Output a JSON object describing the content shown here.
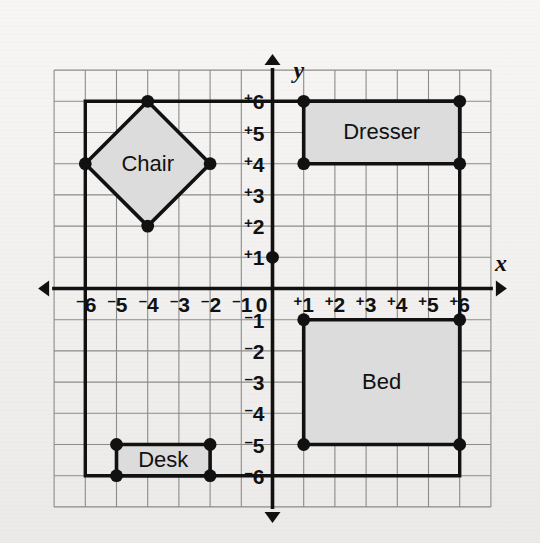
{
  "figure": {
    "background_color": "#f2f1ef",
    "ink_color": "#111111",
    "grid_color": "#8b8b8b",
    "shape_fill_color": "#dcdcdc"
  },
  "axes": {
    "x_label": "x",
    "y_label": "y",
    "origin_label": "0",
    "x_ticks": [
      "-6",
      "-5",
      "-4",
      "-3",
      "-2",
      "-1",
      "+1",
      "+2",
      "+3",
      "+4",
      "+5",
      "+6"
    ],
    "y_ticks": [
      "+6",
      "+5",
      "+4",
      "+3",
      "+2",
      "+1",
      "-1",
      "-2",
      "-3",
      "-4",
      "-5",
      "-6"
    ],
    "x_range": [
      -7,
      7
    ],
    "y_range": [
      -7,
      7
    ],
    "grid": true
  },
  "chart_data": {
    "type": "scatter",
    "xlabel": "x",
    "ylabel": "y",
    "xlim": [
      -7,
      7
    ],
    "ylim": [
      -7,
      7
    ],
    "grid": true,
    "x_tick_labels": [
      "-6",
      "-5",
      "-4",
      "-3",
      "-2",
      "-1",
      "0",
      "+1",
      "+2",
      "+3",
      "+4",
      "+5",
      "+6"
    ],
    "y_tick_labels": [
      "+6",
      "+5",
      "+4",
      "+3",
      "+2",
      "+1",
      "0",
      "-1",
      "-2",
      "-3",
      "-4",
      "-5",
      "-6"
    ],
    "x_tick_values": [
      -6,
      -5,
      -4,
      -3,
      -2,
      -1,
      0,
      1,
      2,
      3,
      4,
      5,
      6
    ],
    "y_tick_values": [
      6,
      5,
      4,
      3,
      2,
      1,
      0,
      -1,
      -2,
      -3,
      -4,
      -5,
      -6
    ],
    "room_outline": {
      "name": "room",
      "vertices": [
        [
          -6,
          6
        ],
        [
          6,
          6
        ],
        [
          6,
          -6
        ],
        [
          -6,
          -6
        ]
      ],
      "closed": true,
      "filled": false
    },
    "marked_points": [
      [
        0,
        1
      ]
    ],
    "shapes": [
      {
        "name": "Chair",
        "label": "Chair",
        "kind": "polygon",
        "vertices": [
          [
            -4,
            6
          ],
          [
            -2,
            4
          ],
          [
            -4,
            2
          ],
          [
            -6,
            4
          ]
        ],
        "label_position": [
          -4,
          4
        ],
        "fill": "#dcdcdc"
      },
      {
        "name": "Dresser",
        "label": "Dresser",
        "kind": "rectangle",
        "vertices": [
          [
            1,
            6
          ],
          [
            6,
            6
          ],
          [
            6,
            4
          ],
          [
            1,
            4
          ]
        ],
        "label_position": [
          3.5,
          5
        ],
        "fill": "#dcdcdc"
      },
      {
        "name": "Bed",
        "label": "Bed",
        "kind": "rectangle",
        "vertices": [
          [
            1,
            -1
          ],
          [
            6,
            -1
          ],
          [
            6,
            -5
          ],
          [
            1,
            -5
          ]
        ],
        "label_position": [
          3.5,
          -3
        ],
        "fill": "#dcdcdc"
      },
      {
        "name": "Desk",
        "label": "Desk",
        "kind": "rectangle",
        "vertices": [
          [
            -5,
            -5
          ],
          [
            -2,
            -5
          ],
          [
            -2,
            -6
          ],
          [
            -5,
            -6
          ]
        ],
        "label_position": [
          -3.5,
          -5.5
        ],
        "fill": "#dcdcdc"
      }
    ]
  }
}
